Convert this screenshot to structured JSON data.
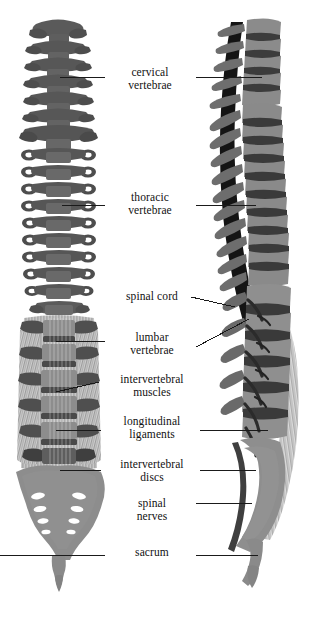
{
  "figure": {
    "background_color": "#ffffff",
    "views": [
      {
        "name": "anterior-view",
        "side": "left"
      },
      {
        "name": "lateral-view",
        "side": "right"
      }
    ],
    "palette": {
      "bone_dark": "#555555",
      "bone_mid": "#6f6f6f",
      "bone_light": "#8a8a8a",
      "bone_pale": "#9a9a9a",
      "canal_dark": "#141414",
      "disc": "#4a4a4a",
      "muscle": "#7d7d7d",
      "foramen": "#ffffff",
      "leader": "#1a1a1a",
      "text": "#111111"
    },
    "labels": [
      {
        "id": "cervical-vertebrae",
        "text": "cervical\nvertebrae",
        "x": 108,
        "y": 66,
        "w": 84,
        "lines": 2
      },
      {
        "id": "thoracic-vertebrae",
        "text": "thoracic\nvertebrae",
        "x": 108,
        "y": 191,
        "w": 84,
        "lines": 2
      },
      {
        "id": "spinal-cord",
        "text": "spinal cord",
        "x": 112,
        "y": 290,
        "w": 80,
        "lines": 1
      },
      {
        "id": "lumbar-vertebrae",
        "text": "lumbar\nvertebrae",
        "x": 110,
        "y": 331,
        "w": 84,
        "lines": 2
      },
      {
        "id": "intervertebral-muscles",
        "text": "intervertebral\nmuscles",
        "x": 104,
        "y": 373,
        "w": 96,
        "lines": 2
      },
      {
        "id": "longitudinal-ligaments",
        "text": "longitudinal\nligaments",
        "x": 104,
        "y": 415,
        "w": 96,
        "lines": 2
      },
      {
        "id": "intervertebral-discs",
        "text": "intervertebral\ndiscs",
        "x": 104,
        "y": 458,
        "w": 96,
        "lines": 2
      },
      {
        "id": "spinal-nerves",
        "text": "spinal\nnerves",
        "x": 112,
        "y": 497,
        "w": 80,
        "lines": 2
      },
      {
        "id": "sacrum",
        "text": "sacrum",
        "x": 112,
        "y": 546,
        "w": 80,
        "lines": 1
      }
    ]
  }
}
